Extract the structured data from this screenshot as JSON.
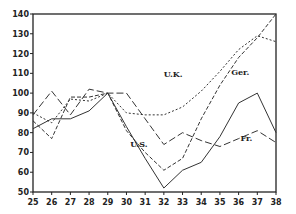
{
  "chart_data": {
    "type": "line",
    "title": "",
    "xlabel": "",
    "ylabel": "",
    "x": [
      25,
      26,
      27,
      28,
      29,
      30,
      31,
      32,
      33,
      34,
      35,
      36,
      37,
      38
    ],
    "xlim": [
      25,
      38
    ],
    "ylim": [
      50,
      140
    ],
    "yticks": [
      50,
      60,
      70,
      80,
      90,
      100,
      110,
      120,
      130,
      140
    ],
    "xticks": [
      "25",
      "26",
      "27",
      "28",
      "29",
      "30",
      "31",
      "32",
      "33",
      "34",
      "35",
      "36",
      "37",
      "38"
    ],
    "grid": false,
    "legend": "inline labels",
    "series": [
      {
        "name": "U.S.",
        "style": "solid",
        "values": [
          82,
          87,
          87,
          91,
          100,
          83,
          67,
          52,
          61,
          65,
          78,
          95,
          100,
          80
        ],
        "label_pos": {
          "x": 30.2,
          "y": 73
        }
      },
      {
        "name": "Ger.",
        "style": "dashed",
        "values": [
          86,
          77,
          98,
          98,
          100,
          81,
          70,
          61,
          67,
          87,
          104,
          118,
          128,
          140
        ],
        "label_pos": {
          "x": 35.6,
          "y": 109
        }
      },
      {
        "name": "U.K.",
        "style": "dotted",
        "values": [
          90,
          85,
          97,
          96,
          100,
          90,
          89,
          89,
          93,
          101,
          111,
          122,
          129,
          126
        ],
        "label_pos": {
          "x": 32.0,
          "y": 108
        }
      },
      {
        "name": "Fr.",
        "style": "long-dash",
        "values": [
          89,
          101,
          89,
          102,
          100,
          100,
          87,
          74,
          80,
          76,
          73,
          77,
          81,
          75
        ],
        "label_pos": {
          "x": 36.1,
          "y": 76
        }
      }
    ]
  }
}
